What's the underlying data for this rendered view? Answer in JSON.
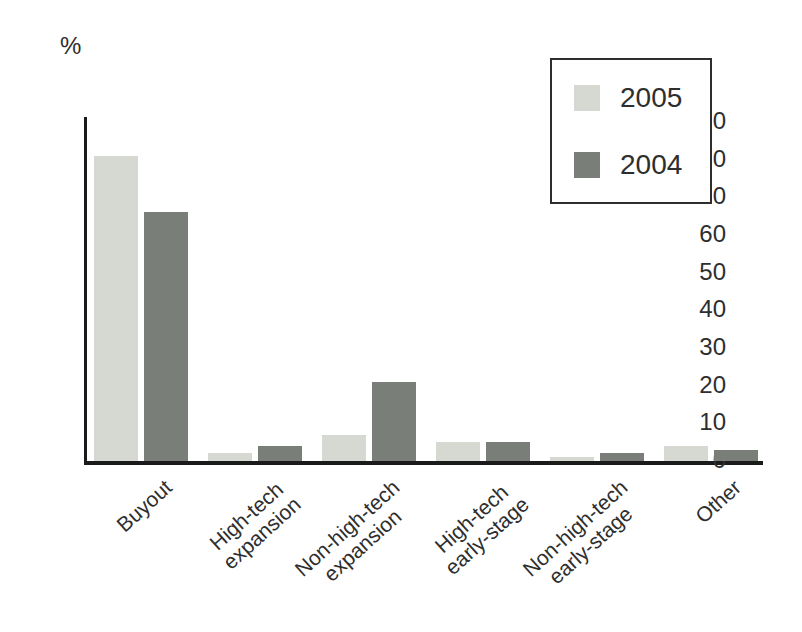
{
  "figure": {
    "unit_label": "%"
  },
  "chart_data": {
    "type": "bar",
    "title": "",
    "xlabel": "",
    "ylabel": "%",
    "categories": [
      "Buyout",
      "High-tech\nexpansion",
      "Non-high-tech\nexpansion",
      "High-tech\nearly-stage",
      "Non-high-tech\nearly-stage",
      "Other"
    ],
    "series": [
      {
        "name": "2005",
        "color": "#d6d9d2",
        "values": [
          81,
          2,
          7,
          5,
          1,
          4
        ]
      },
      {
        "name": "2004",
        "color": "#797e78",
        "values": [
          66,
          4,
          21,
          5,
          2,
          3
        ]
      }
    ],
    "y_ticks": [
      0,
      10,
      20,
      30,
      40,
      50,
      60,
      70,
      80,
      90
    ],
    "ylim": [
      0,
      90
    ],
    "grid": false,
    "legend_position": "top-right"
  },
  "colors": {
    "axis": "#1b1b1b",
    "text": "#2e2e2e",
    "legend_border": "#2e2e2e",
    "background": "#ffffff",
    "series_2005": "#d6d9d2",
    "series_2004": "#797e78"
  }
}
